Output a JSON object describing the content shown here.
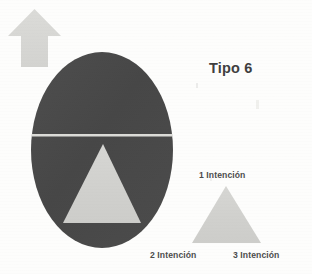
{
  "figure": {
    "title": "Tipo 6",
    "background_color": "#fdfdfc",
    "dark_fill": "#4a4a4a",
    "light_fill": "#d2d2cf",
    "text_color": "#4c4c4c",
    "divider_color": "#dcdcd8"
  },
  "shapes": {
    "arrow": {
      "name": "up-arrow",
      "color": "#d8d8d5",
      "direction": "up",
      "x": 8,
      "y": 9,
      "width": 53,
      "height": 58
    },
    "ellipse": {
      "name": "ellipse",
      "color": "#4a4a4a",
      "cx": 102,
      "cy": 150,
      "rx": 71,
      "ry": 98
    },
    "divider_line": {
      "name": "horizontal-divider",
      "color": "#dcdcd8",
      "y": 135,
      "x1": 32,
      "x2": 172
    },
    "inner_triangle": {
      "name": "inner-triangle",
      "color": "#d2d2cf",
      "apex_x": 103,
      "apex_y": 144,
      "base_left_x": 63,
      "base_right_x": 141,
      "base_y": 223
    },
    "outer_triangle": {
      "name": "legend-triangle",
      "color": "#d2d2cf",
      "apex_x": 226,
      "apex_y": 186,
      "base_left_x": 192,
      "base_right_x": 261,
      "base_y": 243
    }
  },
  "labels": {
    "vertex_1": "1 Intención",
    "vertex_2": "2 Intención",
    "vertex_3": "3 Intención"
  }
}
